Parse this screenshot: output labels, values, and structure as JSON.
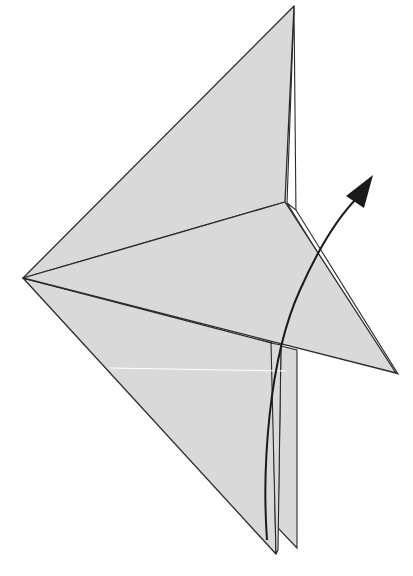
{
  "diagram": {
    "type": "origami-fold-step",
    "colors": {
      "paper": "#d9d9d9",
      "line": "#2a2a2a",
      "arrow": "#1a1a1a",
      "background": "#ffffff",
      "hidden_edge": "#ffffff"
    },
    "elements": [
      {
        "name": "upper-flap",
        "kind": "polygon"
      },
      {
        "name": "lower-body",
        "kind": "polygon"
      },
      {
        "name": "middle-flap",
        "kind": "polygon"
      },
      {
        "name": "right-point",
        "kind": "polygon"
      },
      {
        "name": "leg-strips",
        "kind": "polygon"
      },
      {
        "name": "fold-arrow",
        "kind": "arrow",
        "direction": "up-right"
      }
    ]
  }
}
